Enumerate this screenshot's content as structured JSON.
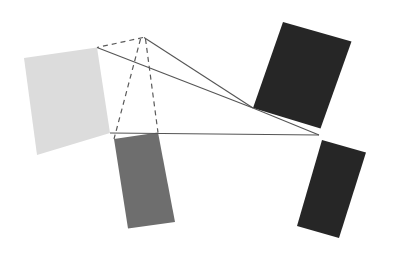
{
  "canvas": {
    "width": 394,
    "height": 265,
    "background_color": "#ffffff",
    "title": "Rotated rectangles with projection lines converging at an apex"
  },
  "palette": {
    "light_gray": "#dcdcdc",
    "medium_gray": "#6e6e6e",
    "dark_near_black": "#262626",
    "line_gray": "#555555",
    "dashed_gray": "#5a5a5a",
    "background": "#ffffff"
  },
  "apex": {
    "label": "apex-point",
    "x": 143,
    "y": 37.5
  },
  "convergence_right": {
    "label": "right-convergence-point",
    "x": 253,
    "y": 108
  },
  "convergence_lower_right": {
    "label": "lower-right-convergence-point",
    "x": 319,
    "y": 135
  },
  "shapes": [
    {
      "name": "light-gray-rectangle",
      "fill": "#dcdcdc",
      "points": "24,58 97,47.5 110,133 37,155",
      "corners": [
        {
          "label": "top-left",
          "x": 24,
          "y": 58
        },
        {
          "label": "top-right",
          "x": 97,
          "y": 47.5
        },
        {
          "label": "bottom-right",
          "x": 110,
          "y": 133
        },
        {
          "label": "bottom-left",
          "x": 37,
          "y": 155
        }
      ]
    },
    {
      "name": "medium-gray-rectangle",
      "fill": "#6e6e6e",
      "points": "114,139 158,132.5 175,222 128,228.5",
      "corners": [
        {
          "label": "top-left",
          "x": 114,
          "y": 139
        },
        {
          "label": "top-right",
          "x": 158,
          "y": 132.5
        },
        {
          "label": "bottom-right",
          "x": 175,
          "y": 222
        },
        {
          "label": "bottom-left",
          "x": 128,
          "y": 228.5
        }
      ]
    },
    {
      "name": "dark-rectangle-upper-right",
      "fill": "#262626",
      "points": "283,22 351.5,41.5 320.5,128.5 253,108",
      "corners": [
        {
          "label": "top-left",
          "x": 283,
          "y": 22
        },
        {
          "label": "top-right",
          "x": 351.5,
          "y": 41.5
        },
        {
          "label": "bottom-right",
          "x": 320.5,
          "y": 128.5
        },
        {
          "label": "bottom-left",
          "x": 253,
          "y": 108
        }
      ]
    },
    {
      "name": "dark-rectangle-lower-right",
      "fill": "#262626",
      "points": "322,140 366,152.5 339,238 297,226",
      "corners": [
        {
          "label": "top-left",
          "x": 322,
          "y": 140
        },
        {
          "label": "top-right",
          "x": 366,
          "y": 152.5
        },
        {
          "label": "bottom-right",
          "x": 339,
          "y": 238
        },
        {
          "label": "bottom-left",
          "x": 297,
          "y": 226
        }
      ]
    }
  ],
  "dashed_lines": [
    {
      "name": "dashed-apex-to-light-rect-top-right",
      "x1": 143,
      "y1": 37.5,
      "x2": 97,
      "y2": 47.5,
      "stroke": "#5a5a5a",
      "stroke_width": 1.2,
      "dash": "5 4"
    },
    {
      "name": "dashed-apex-to-gray-rect-top-left",
      "x1": 140.5,
      "y1": 39,
      "x2": 114,
      "y2": 139,
      "stroke": "#5a5a5a",
      "stroke_width": 1.2,
      "dash": "5 4"
    },
    {
      "name": "dashed-apex-to-gray-rect-top-right",
      "x1": 145.5,
      "y1": 39,
      "x2": 158,
      "y2": 132.5,
      "stroke": "#5a5a5a",
      "stroke_width": 1.2,
      "dash": "5 4"
    }
  ],
  "solid_lines": [
    {
      "name": "solid-apex-to-upper-dark-rect-bottom-left",
      "x1": 144,
      "y1": 37.5,
      "x2": 253,
      "y2": 108,
      "stroke": "#555555",
      "stroke_width": 1.1
    },
    {
      "name": "solid-light-rect-top-right-to-right-convergence",
      "x1": 97,
      "y1": 47.5,
      "x2": 253,
      "y2": 108,
      "stroke": "#555555",
      "stroke_width": 1.1
    },
    {
      "name": "solid-right-convergence-to-lower-right-convergence",
      "x1": 253,
      "y1": 108,
      "x2": 319,
      "y2": 135,
      "stroke": "#555555",
      "stroke_width": 1.1
    },
    {
      "name": "solid-light-rect-bottom-right-to-lower-right-convergence",
      "x1": 110,
      "y1": 133,
      "x2": 319,
      "y2": 135,
      "stroke": "#555555",
      "stroke_width": 1.1
    }
  ]
}
